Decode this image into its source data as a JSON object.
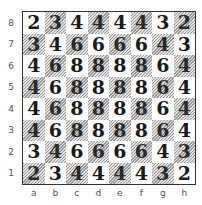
{
  "diagram": {
    "type": "chessboard",
    "colors": {
      "light_square": "#ffffff",
      "dark_square_hatch": "#9a9a9a",
      "border": "#333333",
      "text": "#1a1a1a",
      "label": "#555555"
    },
    "ranks": [
      "8",
      "7",
      "6",
      "5",
      "4",
      "3",
      "2",
      "1"
    ],
    "files": [
      "a",
      "b",
      "c",
      "d",
      "e",
      "f",
      "g",
      "h"
    ],
    "rows": [
      [
        "2",
        "3",
        "4",
        "4",
        "4",
        "4",
        "3",
        "2"
      ],
      [
        "3",
        "4",
        "6",
        "6",
        "6",
        "6",
        "4",
        "3"
      ],
      [
        "4",
        "6",
        "8",
        "8",
        "8",
        "8",
        "6",
        "4"
      ],
      [
        "4",
        "6",
        "8",
        "8",
        "8",
        "8",
        "6",
        "4"
      ],
      [
        "4",
        "6",
        "8",
        "8",
        "8",
        "8",
        "6",
        "4"
      ],
      [
        "4",
        "6",
        "8",
        "8",
        "8",
        "8",
        "6",
        "4"
      ],
      [
        "3",
        "4",
        "6",
        "6",
        "6",
        "6",
        "4",
        "3"
      ],
      [
        "2",
        "3",
        "4",
        "4",
        "4",
        "4",
        "3",
        "2"
      ]
    ]
  }
}
